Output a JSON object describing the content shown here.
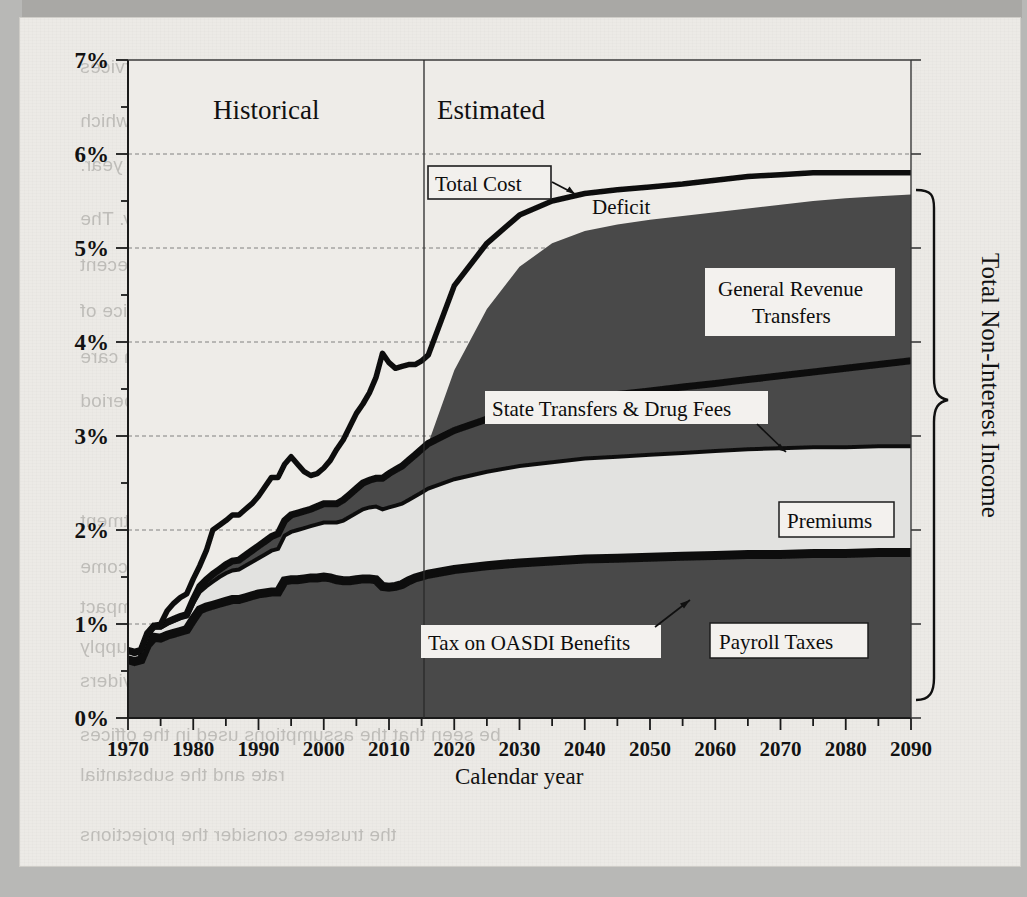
{
  "figure": {
    "era_labels": [
      {
        "key": "historical",
        "text": "Historical"
      },
      {
        "key": "estimated",
        "text": "Estimated"
      }
    ],
    "xlabel": "Calendar year",
    "right_bracket_label": "Total Non-Interest Income"
  },
  "annotations": {
    "total_cost": "Total Cost",
    "deficit": "Deficit",
    "general_revenue_transfers_line1": "General Revenue",
    "general_revenue_transfers_line2": "Transfers",
    "state_transfers_drug_fees": "State Transfers & Drug Fees",
    "premiums": "Premiums",
    "tax_on_oasdi_benefits": "Tax on OASDI Benefits",
    "payroll_taxes": "Payroll Taxes"
  },
  "colors": {
    "area_dark": "#4a4a4a",
    "area_light": "#e2e2e0",
    "line_black": "#101010",
    "plot_bg": "#eeece8",
    "paper": "#eceae6",
    "grid": "#6f6f6f"
  },
  "bleed_text": [
    {
      "x": 60,
      "y": 38,
      "text": "utable to a reduction in the annual payment updates for most Medicare services"
    },
    {
      "x": 60,
      "y": 92,
      "text": "ons services and drugs) by total economic (multifactor) productivity growth, which"
    },
    {
      "x": 60,
      "y": 136,
      "text": "eraged 1.1% per year."
    },
    {
      "x": 60,
      "y": 190,
      "text": "U.S. economy as a whole has slowed considerably. The"
    },
    {
      "x": 60,
      "y": 236,
      "text": "ecent productivity slowdown reflects the impact of the recent"
    },
    {
      "x": 60,
      "y": 282,
      "text": "will be temporary because substantial increases in the price of"
    },
    {
      "x": 60,
      "y": 328,
      "text": "ation, and it is possible that U.S. health care"
    },
    {
      "x": 60,
      "y": 372,
      "text": "in the economy has occurred during the period"
    },
    {
      "x": 60,
      "y": 492,
      "text": "ost-sharing and the loss of savings. Adjustment"
    },
    {
      "x": 60,
      "y": 538,
      "text": "of a substantial portion of physician income"
    },
    {
      "x": 60,
      "y": 578,
      "text": "the suggestion that increases with the impact"
    },
    {
      "x": 60,
      "y": 618,
      "text": "such as the prospect of the supply"
    },
    {
      "x": 60,
      "y": 652,
      "text": "in providers"
    },
    {
      "x": 60,
      "y": 706,
      "text": "be seen that the assumptions used in the offices"
    },
    {
      "x": 60,
      "y": 746,
      "text": "rate and the substantial"
    },
    {
      "x": 60,
      "y": 806,
      "text": "the trustees consider the projections"
    }
  ],
  "chart_data": {
    "type": "area",
    "title": "",
    "xlabel": "Calendar year",
    "ylabel": "",
    "xlim": [
      1970,
      2090
    ],
    "ylim": [
      0,
      7
    ],
    "xticks": [
      1970,
      1980,
      1990,
      2000,
      2010,
      2020,
      2030,
      2040,
      2050,
      2060,
      2070,
      2080,
      2090
    ],
    "xtick_labels": [
      "1970",
      "1980",
      "1990",
      "2000",
      "2010",
      "2020",
      "2030",
      "2040",
      "2050",
      "2060",
      "2070",
      "2080",
      "2090"
    ],
    "xminor_step": 5,
    "yticks": [
      0,
      1,
      2,
      3,
      4,
      5,
      6,
      7
    ],
    "ytick_labels": [
      "0%",
      "1%",
      "2%",
      "3%",
      "4%",
      "5%",
      "6%",
      "7%"
    ],
    "yminor_step": 0.5,
    "grid": "horizontal-dashed",
    "units": "Percent of GDP",
    "historical_estimated_split_year": 2016,
    "stacking": "cumulative",
    "x": [
      1970,
      1971,
      1972,
      1973,
      1974,
      1975,
      1976,
      1977,
      1978,
      1979,
      1980,
      1981,
      1982,
      1983,
      1984,
      1985,
      1986,
      1987,
      1988,
      1989,
      1990,
      1991,
      1992,
      1993,
      1994,
      1995,
      1996,
      1997,
      1998,
      1999,
      2000,
      2001,
      2002,
      2003,
      2004,
      2005,
      2006,
      2007,
      2008,
      2009,
      2010,
      2011,
      2012,
      2013,
      2014,
      2015,
      2016,
      2020,
      2025,
      2030,
      2035,
      2040,
      2045,
      2050,
      2055,
      2060,
      2065,
      2070,
      2075,
      2080,
      2085,
      2090
    ],
    "series": [
      {
        "name": "Payroll Taxes",
        "role": "bottom cumulative band (dark)",
        "values": [
          0.62,
          0.6,
          0.62,
          0.78,
          0.86,
          0.85,
          0.88,
          0.9,
          0.92,
          0.94,
          1.05,
          1.15,
          1.18,
          1.2,
          1.22,
          1.24,
          1.26,
          1.26,
          1.28,
          1.3,
          1.32,
          1.33,
          1.34,
          1.34,
          1.4,
          1.41,
          1.41,
          1.42,
          1.43,
          1.43,
          1.44,
          1.43,
          1.41,
          1.4,
          1.4,
          1.41,
          1.42,
          1.42,
          1.41,
          1.34,
          1.33,
          1.34,
          1.35,
          1.38,
          1.4,
          1.41,
          1.42,
          1.45,
          1.47,
          1.48,
          1.49,
          1.5,
          1.51,
          1.52,
          1.53,
          1.54,
          1.55,
          1.55,
          1.56,
          1.56,
          1.57,
          1.57
        ]
      },
      {
        "name": "Tax on OASDI Benefits",
        "role": "thin black band above payroll taxes (cumulative top)",
        "values": [
          0.62,
          0.6,
          0.62,
          0.78,
          0.86,
          0.85,
          0.88,
          0.9,
          0.92,
          0.94,
          1.05,
          1.15,
          1.18,
          1.2,
          1.22,
          1.24,
          1.26,
          1.26,
          1.28,
          1.3,
          1.32,
          1.33,
          1.34,
          1.34,
          1.46,
          1.47,
          1.47,
          1.48,
          1.49,
          1.49,
          1.5,
          1.49,
          1.47,
          1.46,
          1.46,
          1.47,
          1.48,
          1.48,
          1.47,
          1.4,
          1.39,
          1.4,
          1.42,
          1.46,
          1.49,
          1.51,
          1.53,
          1.58,
          1.62,
          1.65,
          1.67,
          1.69,
          1.7,
          1.71,
          1.72,
          1.73,
          1.74,
          1.74,
          1.75,
          1.75,
          1.76,
          1.76
        ]
      },
      {
        "name": "Premiums",
        "role": "light band (cumulative top)",
        "values": [
          0.7,
          0.68,
          0.7,
          0.88,
          0.96,
          0.96,
          1.0,
          1.03,
          1.06,
          1.08,
          1.22,
          1.34,
          1.4,
          1.45,
          1.5,
          1.54,
          1.57,
          1.58,
          1.62,
          1.66,
          1.7,
          1.74,
          1.78,
          1.8,
          1.94,
          1.98,
          2.0,
          2.02,
          2.04,
          2.06,
          2.08,
          2.08,
          2.08,
          2.1,
          2.14,
          2.18,
          2.22,
          2.24,
          2.25,
          2.22,
          2.24,
          2.26,
          2.28,
          2.32,
          2.36,
          2.4,
          2.44,
          2.54,
          2.62,
          2.68,
          2.72,
          2.76,
          2.78,
          2.8,
          2.82,
          2.84,
          2.86,
          2.87,
          2.88,
          2.88,
          2.89,
          2.89
        ]
      },
      {
        "name": "State Transfers & Drug Fees",
        "role": "thin dark band (cumulative top)",
        "values": [
          0.72,
          0.7,
          0.72,
          0.9,
          0.98,
          0.98,
          1.02,
          1.05,
          1.08,
          1.1,
          1.26,
          1.4,
          1.47,
          1.53,
          1.58,
          1.63,
          1.67,
          1.68,
          1.73,
          1.78,
          1.83,
          1.88,
          1.93,
          1.96,
          2.1,
          2.16,
          2.18,
          2.2,
          2.22,
          2.25,
          2.28,
          2.28,
          2.28,
          2.32,
          2.38,
          2.44,
          2.5,
          2.53,
          2.55,
          2.55,
          2.6,
          2.64,
          2.68,
          2.74,
          2.8,
          2.86,
          2.92,
          3.06,
          3.18,
          3.26,
          3.34,
          3.4,
          3.44,
          3.48,
          3.52,
          3.56,
          3.6,
          3.64,
          3.68,
          3.72,
          3.76,
          3.8
        ]
      },
      {
        "name": "General Revenue Transfers",
        "role": "large dark area = Total Non-Interest Income top",
        "values": [
          0.72,
          0.7,
          0.72,
          0.9,
          0.98,
          0.98,
          1.02,
          1.05,
          1.08,
          1.1,
          1.26,
          1.4,
          1.47,
          1.53,
          1.58,
          1.63,
          1.67,
          1.68,
          1.73,
          1.78,
          1.83,
          1.88,
          1.93,
          1.96,
          2.1,
          2.16,
          2.18,
          2.2,
          2.22,
          2.25,
          2.28,
          2.28,
          2.28,
          2.32,
          2.38,
          2.44,
          2.5,
          2.53,
          2.55,
          2.55,
          2.6,
          2.64,
          2.68,
          2.74,
          2.8,
          2.86,
          2.92,
          3.7,
          4.35,
          4.8,
          5.05,
          5.18,
          5.25,
          5.3,
          5.34,
          5.38,
          5.42,
          5.46,
          5.5,
          5.53,
          5.55,
          5.57
        ]
      },
      {
        "name": "Total Cost",
        "role": "bold black line (top of chart)",
        "values": [
          0.72,
          0.7,
          0.72,
          0.9,
          0.98,
          1.0,
          1.14,
          1.22,
          1.28,
          1.32,
          1.48,
          1.62,
          1.78,
          2.0,
          2.05,
          2.1,
          2.16,
          2.16,
          2.22,
          2.28,
          2.36,
          2.46,
          2.56,
          2.56,
          2.7,
          2.78,
          2.7,
          2.62,
          2.58,
          2.6,
          2.66,
          2.74,
          2.86,
          2.96,
          3.1,
          3.24,
          3.34,
          3.46,
          3.62,
          3.88,
          3.78,
          3.72,
          3.74,
          3.76,
          3.76,
          3.8,
          3.86,
          4.6,
          5.05,
          5.35,
          5.5,
          5.58,
          5.62,
          5.65,
          5.68,
          5.72,
          5.76,
          5.78,
          5.8,
          5.8,
          5.8,
          5.8
        ]
      }
    ],
    "legend_position": "in-plot callouts"
  }
}
